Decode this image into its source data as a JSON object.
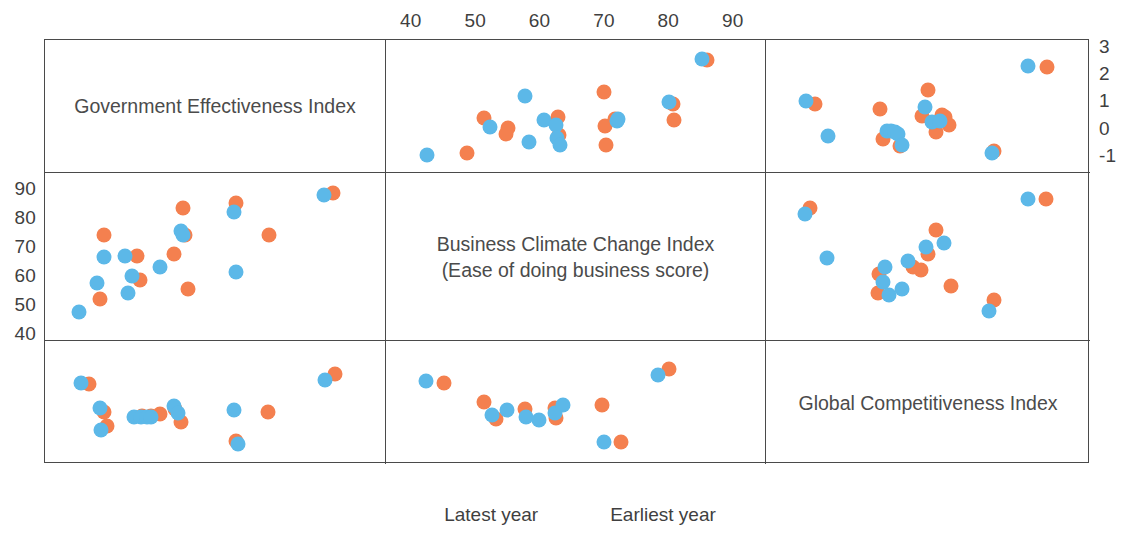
{
  "chart_data": {
    "type": "scatter",
    "title": "",
    "layout": "3x3 scatter-plot matrix (SPLOM) with variable names on the diagonal",
    "legend": {
      "position": "bottom-center",
      "entries": [
        {
          "name": "Latest year",
          "color": "#f4804f"
        },
        {
          "name": "Earliest year",
          "color": "#5cb8e8"
        }
      ]
    },
    "variables": [
      {
        "key": "gov",
        "name": "Government Effectiveness Index",
        "axis": "bottom-left",
        "ticks": [
          "-1",
          "0",
          "1",
          "2",
          "3"
        ],
        "range": [
          -1.5,
          3.0
        ]
      },
      {
        "key": "biz",
        "name": "Business Climate Change Index",
        "name_line2": "(Ease of doing business score)",
        "axis": "top-center / left",
        "ticks": [
          "40",
          "50",
          "60",
          "70",
          "80",
          "90"
        ],
        "range": [
          36,
          95
        ]
      },
      {
        "key": "gci",
        "name": "Global Competitiveness Index",
        "axis": "bottom-right / right",
        "ticks": [
          "3",
          "4",
          "5",
          "6"
        ],
        "range": [
          2.75,
          6.2
        ]
      }
    ],
    "axes": {
      "top": {
        "label": "",
        "ticks": [
          40,
          50,
          60,
          70,
          80,
          90
        ],
        "variable": "biz"
      },
      "bottom_left": {
        "label": "",
        "ticks": [
          -1,
          0,
          1,
          2,
          3
        ],
        "variable": "gov"
      },
      "bottom_right": {
        "label": "",
        "ticks": [
          3,
          4,
          5,
          6
        ],
        "variable": "gci"
      },
      "left": {
        "label": "",
        "ticks": [
          90,
          80,
          70,
          60,
          50,
          40
        ],
        "variable": "biz"
      },
      "right_top": {
        "label": "",
        "ticks": [
          3,
          2,
          1,
          0,
          -1
        ],
        "variable": "gov"
      },
      "right_bottom": {
        "label": "",
        "ticks": [
          6,
          5,
          4,
          3
        ],
        "variable": "gci"
      }
    },
    "grid": false,
    "panels": [
      {
        "id": "r1c1",
        "kind": "label",
        "text": "Government Effectiveness Index"
      },
      {
        "id": "r1c2",
        "kind": "scatter",
        "xvar": "biz",
        "yvar": "gov",
        "xlim": [
          36,
          95
        ],
        "ylim": [
          -1.6,
          3.3
        ],
        "series": [
          {
            "name": "Latest year",
            "color": "#f4804f",
            "points": [
              [
                48.5,
                -0.85
              ],
              [
                51.2,
                0.42
              ],
              [
                54.6,
                -0.15
              ],
              [
                55.0,
                0.05
              ],
              [
                62.7,
                0.45
              ],
              [
                62.8,
                -0.2
              ],
              [
                69.9,
                1.4
              ],
              [
                70.0,
                0.12
              ],
              [
                70.1,
                -0.55
              ],
              [
                71.5,
                0.4
              ],
              [
                80.6,
                0.95
              ],
              [
                80.7,
                0.35
              ],
              [
                85.8,
                2.55
              ]
            ]
          },
          {
            "name": "Earliest year",
            "color": "#5cb8e8",
            "points": [
              [
                42.4,
                -0.95
              ],
              [
                52.2,
                0.1
              ],
              [
                57.5,
                1.25
              ],
              [
                58.2,
                -0.45
              ],
              [
                60.6,
                0.35
              ],
              [
                62.4,
                0.18
              ],
              [
                62.6,
                -0.3
              ],
              [
                63.0,
                -0.55
              ],
              [
                71.8,
                0.3
              ],
              [
                72.0,
                0.4
              ],
              [
                79.9,
                1.0
              ],
              [
                85.0,
                2.6
              ]
            ]
          }
        ]
      },
      {
        "id": "r1c3",
        "kind": "scatter",
        "xvar": "gci",
        "yvar": "gov",
        "xlim": [
          2.75,
          6.2
        ],
        "ylim": [
          -1.6,
          3.3
        ],
        "series": [
          {
            "name": "Latest year",
            "color": "#f4804f",
            "points": [
              [
                3.27,
                0.95
              ],
              [
                3.96,
                0.75
              ],
              [
                3.99,
                -0.35
              ],
              [
                4.18,
                -0.6
              ],
              [
                4.41,
                0.5
              ],
              [
                4.47,
                1.45
              ],
              [
                4.56,
                -0.1
              ],
              [
                4.62,
                0.55
              ],
              [
                4.66,
                0.45
              ],
              [
                4.7,
                0.18
              ],
              [
                5.18,
                -0.8
              ],
              [
                5.74,
                2.3
              ]
            ]
          },
          {
            "name": "Earliest year",
            "color": "#5cb8e8",
            "points": [
              [
                3.18,
                1.05
              ],
              [
                3.41,
                -0.25
              ],
              [
                4.04,
                -0.05
              ],
              [
                4.08,
                -0.05
              ],
              [
                4.12,
                -0.1
              ],
              [
                4.16,
                -0.15
              ],
              [
                4.2,
                -0.55
              ],
              [
                4.44,
                0.85
              ],
              [
                4.52,
                0.28
              ],
              [
                4.6,
                0.3
              ],
              [
                5.16,
                -0.85
              ],
              [
                5.54,
                2.35
              ]
            ]
          }
        ]
      },
      {
        "id": "r2c1",
        "kind": "scatter",
        "xvar": "gov",
        "yvar": "biz",
        "xlim": [
          -1.5,
          3.0
        ],
        "ylim": [
          38,
          96
        ],
        "series": [
          {
            "name": "Latest year",
            "color": "#f4804f",
            "points": [
              [
                -0.78,
                52.5
              ],
              [
                -0.72,
                74.5
              ],
              [
                -0.28,
                67.5
              ],
              [
                -0.25,
                59.0
              ],
              [
                0.2,
                68.0
              ],
              [
                0.32,
                84.0
              ],
              [
                0.35,
                74.5
              ],
              [
                0.38,
                56.0
              ],
              [
                1.02,
                85.5
              ],
              [
                1.45,
                74.5
              ],
              [
                2.3,
                89.0
              ]
            ]
          },
          {
            "name": "Earliest year",
            "color": "#5cb8e8",
            "points": [
              [
                -1.05,
                48.0
              ],
              [
                -0.82,
                58.0
              ],
              [
                -0.72,
                67.0
              ],
              [
                -0.45,
                67.5
              ],
              [
                -0.4,
                54.5
              ],
              [
                -0.35,
                60.5
              ],
              [
                0.02,
                63.5
              ],
              [
                0.3,
                76.0
              ],
              [
                0.32,
                74.5
              ],
              [
                1.0,
                82.5
              ],
              [
                1.02,
                62.0
              ],
              [
                2.18,
                88.5
              ]
            ]
          }
        ]
      },
      {
        "id": "r2c2",
        "kind": "label",
        "text": "Business Climate Change Index",
        "text2": "(Ease of doing business score)"
      },
      {
        "id": "r2c3",
        "kind": "scatter",
        "xvar": "gci",
        "yvar": "biz",
        "xlim": [
          2.75,
          6.2
        ],
        "ylim": [
          38,
          96
        ],
        "series": [
          {
            "name": "Latest year",
            "color": "#f4804f",
            "points": [
              [
                3.22,
                84.0
              ],
              [
                3.95,
                61.0
              ],
              [
                3.94,
                54.5
              ],
              [
                4.32,
                63.5
              ],
              [
                4.4,
                62.5
              ],
              [
                4.47,
                68.0
              ],
              [
                4.56,
                76.5
              ],
              [
                4.72,
                57.0
              ],
              [
                5.18,
                52.0
              ],
              [
                5.73,
                87.0
              ]
            ]
          },
          {
            "name": "Earliest year",
            "color": "#5cb8e8",
            "points": [
              [
                3.16,
                82.0
              ],
              [
                3.4,
                66.5
              ],
              [
                4.02,
                63.5
              ],
              [
                4.0,
                58.5
              ],
              [
                4.06,
                54.0
              ],
              [
                4.2,
                56.0
              ],
              [
                4.26,
                65.5
              ],
              [
                4.45,
                70.5
              ],
              [
                4.65,
                72.0
              ],
              [
                5.12,
                48.5
              ],
              [
                5.54,
                87.0
              ]
            ]
          }
        ]
      },
      {
        "id": "r3c1",
        "kind": "scatter",
        "xvar": "gov",
        "yvar": "gci",
        "xlim": [
          -1.5,
          3.0
        ],
        "ylim": [
          2.75,
          6.3
        ],
        "series": [
          {
            "name": "Latest year",
            "color": "#f4804f",
            "points": [
              [
                -0.92,
                5.05
              ],
              [
                -0.72,
                4.25
              ],
              [
                -0.68,
                3.85
              ],
              [
                -0.22,
                4.15
              ],
              [
                -0.1,
                4.15
              ],
              [
                0.02,
                4.2
              ],
              [
                0.22,
                4.35
              ],
              [
                0.3,
                3.95
              ],
              [
                1.02,
                3.42
              ],
              [
                1.44,
                4.25
              ],
              [
                2.32,
                5.35
              ]
            ]
          },
          {
            "name": "Earliest year",
            "color": "#5cb8e8",
            "points": [
              [
                -1.02,
                5.08
              ],
              [
                -0.78,
                4.38
              ],
              [
                -0.76,
                3.72
              ],
              [
                -0.32,
                4.1
              ],
              [
                -0.24,
                4.1
              ],
              [
                -0.16,
                4.12
              ],
              [
                -0.1,
                4.12
              ],
              [
                0.2,
                4.42
              ],
              [
                0.25,
                4.22
              ],
              [
                1.0,
                4.3
              ],
              [
                1.04,
                3.32
              ],
              [
                2.2,
                5.18
              ]
            ]
          }
        ]
      },
      {
        "id": "r3c2",
        "kind": "scatter",
        "xvar": "biz",
        "yvar": "gci",
        "xlim": [
          36,
          95
        ],
        "ylim": [
          2.75,
          6.3
        ],
        "series": [
          {
            "name": "Latest year",
            "color": "#f4804f",
            "points": [
              [
                45.0,
                5.1
              ],
              [
                51.2,
                4.55
              ],
              [
                53.0,
                4.05
              ],
              [
                57.5,
                4.35
              ],
              [
                62.3,
                4.38
              ],
              [
                62.4,
                4.08
              ],
              [
                69.5,
                4.45
              ],
              [
                72.5,
                3.38
              ],
              [
                80.0,
                5.5
              ]
            ]
          },
          {
            "name": "Earliest year",
            "color": "#5cb8e8",
            "points": [
              [
                42.2,
                5.15
              ],
              [
                52.5,
                4.18
              ],
              [
                54.8,
                4.3
              ],
              [
                57.8,
                4.12
              ],
              [
                59.8,
                4.02
              ],
              [
                62.2,
                4.22
              ],
              [
                63.5,
                4.45
              ],
              [
                69.8,
                3.4
              ],
              [
                78.2,
                5.32
              ]
            ]
          }
        ]
      },
      {
        "id": "r3c3",
        "kind": "label",
        "text": "Global Competitiveness Index"
      }
    ]
  }
}
